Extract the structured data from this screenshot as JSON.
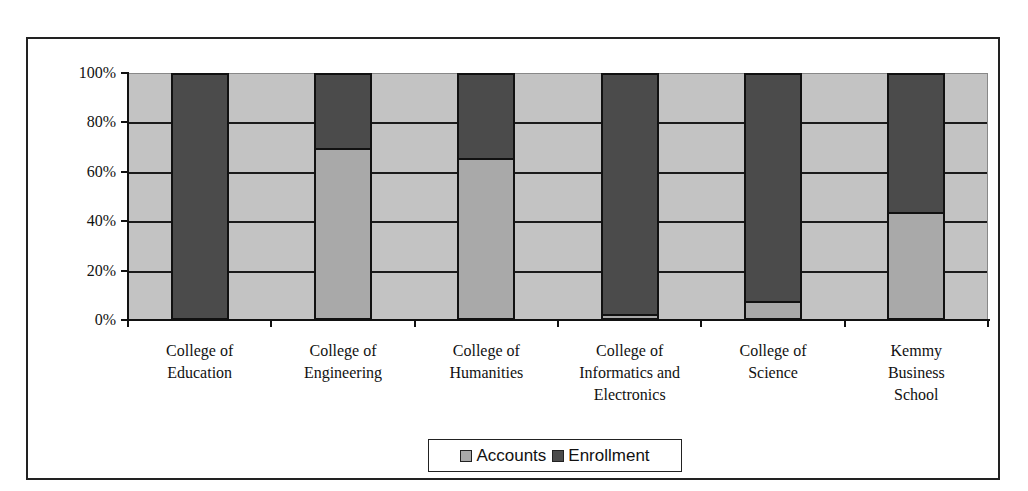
{
  "chart_data": {
    "type": "bar",
    "stacked": "percent",
    "title": "",
    "xlabel": "",
    "ylabel": "",
    "ylim": [
      0,
      100
    ],
    "y_ticks": [
      "0%",
      "20%",
      "40%",
      "60%",
      "80%",
      "100%"
    ],
    "grid": true,
    "legend_position": "bottom",
    "categories": [
      "College of Education",
      "College of Engineering",
      "College of Humanities",
      "College of Informatics and Electronics",
      "College of Science",
      "Kemmy Business School"
    ],
    "category_labels_wrapped": [
      "College of\nEducation",
      "College of\nEngineering",
      "College of\nHumanities",
      "College of\nInformatics and\nElectronics",
      "College of\nScience",
      "Kemmy\nBusiness\nSchool"
    ],
    "series": [
      {
        "name": "Accounts",
        "color": "#a9a9a9",
        "values": [
          0,
          69,
          65,
          1,
          6,
          43
        ]
      },
      {
        "name": "Enrollment",
        "color": "#4b4b4b",
        "values": [
          100,
          31,
          35,
          99,
          94,
          57
        ]
      }
    ]
  },
  "colors": {
    "plot_background": "#c3c3c3",
    "gridline": "#1a1a1a",
    "accounts": "#a9a9a9",
    "enrollment": "#4b4b4b"
  },
  "legend": {
    "items": [
      {
        "label": "Accounts",
        "color": "#a9a9a9"
      },
      {
        "label": "Enrollment",
        "color": "#4b4b4b"
      }
    ]
  }
}
